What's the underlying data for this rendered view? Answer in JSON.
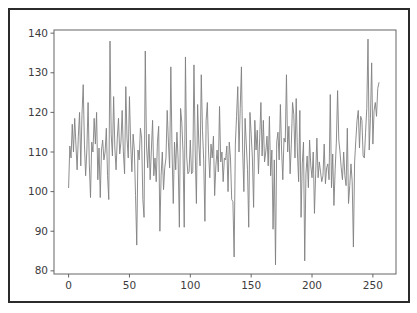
{
  "figure": {
    "background": "#ffffff",
    "frame_color": "#2b2b2b",
    "axes_color": "#555555",
    "tick_label_color": "#3c3c3c"
  },
  "chart_data": {
    "type": "line",
    "title": "",
    "xlabel": "",
    "ylabel": "",
    "xlim": [
      -12,
      269
    ],
    "ylim": [
      79.2,
      140.8
    ],
    "grid": false,
    "legend": null,
    "line_color": "#808080",
    "line_width": 0.9,
    "xticks": [
      0,
      50,
      100,
      150,
      200,
      250
    ],
    "xtick_labels": [
      "0",
      "50",
      "100",
      "150",
      "200",
      "250"
    ],
    "yticks": [
      80,
      90,
      100,
      110,
      120,
      130,
      140
    ],
    "ytick_labels": [
      "80",
      "90",
      "100",
      "110",
      "120",
      "130",
      "140"
    ],
    "series": [
      {
        "name": "series-1",
        "x_start": 0,
        "x_step": 1,
        "values": [
          101.0,
          111.5,
          108.5,
          117.0,
          110.0,
          118.5,
          112.0,
          105.5,
          114.0,
          120.0,
          106.5,
          119.5,
          127.0,
          112.0,
          104.0,
          110.5,
          122.5,
          107.0,
          98.5,
          112.5,
          110.0,
          118.5,
          112.0,
          120.0,
          103.0,
          111.0,
          98.5,
          110.5,
          113.0,
          108.0,
          110.0,
          116.0,
          104.0,
          98.0,
          138.0,
          114.5,
          109.0,
          124.0,
          111.0,
          105.5,
          113.5,
          118.5,
          109.5,
          112.5,
          120.5,
          110.0,
          104.5,
          126.5,
          113.5,
          108.5,
          124.0,
          112.0,
          105.0,
          114.5,
          110.5,
          99.0,
          86.5,
          110.5,
          108.0,
          116.0,
          113.5,
          98.0,
          93.5,
          135.5,
          111.5,
          106.0,
          114.5,
          103.0,
          110.5,
          118.0,
          104.0,
          108.5,
          102.5,
          112.5,
          116.5,
          90.0,
          104.0,
          110.0,
          100.5,
          106.0,
          108.5,
          120.5,
          112.5,
          106.0,
          131.5,
          110.0,
          97.0,
          112.5,
          105.5,
          115.0,
          108.0,
          91.0,
          121.0,
          117.5,
          110.0,
          91.0,
          134.0,
          109.0,
          104.5,
          105.0,
          113.0,
          104.5,
          105.0,
          132.0,
          110.5,
          97.0,
          122.0,
          112.0,
          106.5,
          129.5,
          115.5,
          108.0,
          92.5,
          118.0,
          122.5,
          110.0,
          103.5,
          112.0,
          108.5,
          114.0,
          99.0,
          106.5,
          110.5,
          105.0,
          121.5,
          107.5,
          110.0,
          102.5,
          108.5,
          108.0,
          111.5,
          100.0,
          112.5,
          108.5,
          98.0,
          97.5,
          83.5,
          112.0,
          119.0,
          126.5,
          110.0,
          121.0,
          131.5,
          110.5,
          100.0,
          118.5,
          112.0,
          105.5,
          91.0,
          120.0,
          114.5,
          108.5,
          96.0,
          118.0,
          110.5,
          115.5,
          104.5,
          113.5,
          122.5,
          109.0,
          118.0,
          107.5,
          110.0,
          114.0,
          106.5,
          119.0,
          104.0,
          110.5,
          90.5,
          108.0,
          81.5,
          112.5,
          115.0,
          108.0,
          122.0,
          110.5,
          103.0,
          113.5,
          112.5,
          129.5,
          110.0,
          116.5,
          104.5,
          112.0,
          122.5,
          119.5,
          108.5,
          123.5,
          110.0,
          102.5,
          120.5,
          93.5,
          107.0,
          112.5,
          82.5,
          104.5,
          109.0,
          101.0,
          113.0,
          106.5,
          103.5,
          110.0,
          94.5,
          104.5,
          113.5,
          103.5,
          107.5,
          105.0,
          102.5,
          104.0,
          112.0,
          102.0,
          106.0,
          107.0,
          103.0,
          124.5,
          101.0,
          109.5,
          96.5,
          105.5,
          112.5,
          125.5,
          113.0,
          110.0,
          106.0,
          103.0,
          110.0,
          104.0,
          101.5,
          116.0,
          97.0,
          101.5,
          107.0,
          102.5,
          86.0,
          107.5,
          113.0,
          118.0,
          120.5,
          111.0,
          119.0,
          118.0,
          109.0,
          108.5,
          115.0,
          121.0,
          138.5,
          110.5,
          118.5,
          132.5,
          112.0,
          120.5,
          122.5,
          119.0,
          126.0,
          127.5
        ]
      }
    ]
  }
}
